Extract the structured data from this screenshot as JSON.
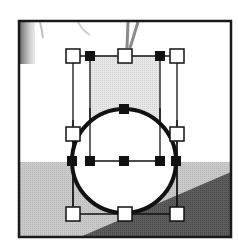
{
  "canvas": {
    "width": 238,
    "height": 240,
    "background": "#ffffff"
  },
  "frame": {
    "x": 19,
    "y": 21,
    "w": 212,
    "h": 216,
    "stroke": "#1a1a1a",
    "stroke_width": 2.5
  },
  "scene": {
    "ground_y": 162,
    "ground_color": "#c8c8c8",
    "dark_wedge_color": "#5a5a5a",
    "dark_wedge_points": "80,237 231,172 231,237",
    "sky_color": "#ffffff",
    "tree_trunk_color": "#8a8a8a",
    "left_dark_strip_color": "#7a7a7a"
  },
  "selection": {
    "fill_rect": {
      "x": 90,
      "y": 56,
      "w": 70,
      "h": 105,
      "color": "#e4e4e4"
    },
    "outer_box": {
      "x": 73,
      "y": 56,
      "w": 104,
      "h": 158
    },
    "inner_box": {
      "x": 90,
      "y": 56,
      "w": 70,
      "h": 105
    },
    "line_color": "#111111",
    "white_handles": [
      {
        "name": "handle-top-left",
        "cx": 73,
        "cy": 56
      },
      {
        "name": "handle-top-center",
        "cx": 125,
        "cy": 56
      },
      {
        "name": "handle-top-right",
        "cx": 177,
        "cy": 56
      },
      {
        "name": "handle-middle-left",
        "cx": 73,
        "cy": 134
      },
      {
        "name": "handle-middle-right",
        "cx": 177,
        "cy": 134
      },
      {
        "name": "handle-bottom-left",
        "cx": 73,
        "cy": 214
      },
      {
        "name": "handle-bottom-center",
        "cx": 125,
        "cy": 214
      },
      {
        "name": "handle-bottom-right",
        "cx": 177,
        "cy": 214
      }
    ],
    "black_handles": [
      {
        "name": "anchor-top-inner-left",
        "cx": 90,
        "cy": 56
      },
      {
        "name": "anchor-top-inner-right",
        "cx": 160,
        "cy": 56
      },
      {
        "name": "anchor-circle-top",
        "cx": 124,
        "cy": 109
      },
      {
        "name": "anchor-circle-left",
        "cx": 72,
        "cy": 161
      },
      {
        "name": "anchor-inner-left",
        "cx": 90,
        "cy": 161
      },
      {
        "name": "anchor-center",
        "cx": 124,
        "cy": 161
      },
      {
        "name": "anchor-inner-right",
        "cx": 160,
        "cy": 161
      },
      {
        "name": "anchor-circle-right",
        "cx": 176,
        "cy": 161
      }
    ],
    "circle": {
      "cx": 124,
      "cy": 161,
      "r": 52,
      "fill": "#ffffff",
      "stroke": "#111111",
      "stroke_width": 4
    }
  }
}
